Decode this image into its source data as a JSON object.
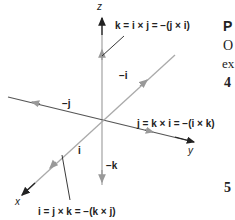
{
  "diagram": {
    "axes": {
      "x": "x",
      "y": "y",
      "z": "z"
    },
    "vectors": {
      "k_eq": "k = i × j = −(j × i)",
      "j_eq": "j = k × i = −(i × k)",
      "i_eq": "i = j × k = −(k × j)",
      "neg_i": "−i",
      "neg_j": "−j",
      "neg_k": "−k",
      "i": "i"
    },
    "colors": {
      "axis_dark": "#222222",
      "vector_gray": "#999999"
    }
  },
  "side_text": {
    "heading": "P",
    "line1": "O",
    "line2": "ex",
    "num4": "4",
    "num5": "5"
  }
}
